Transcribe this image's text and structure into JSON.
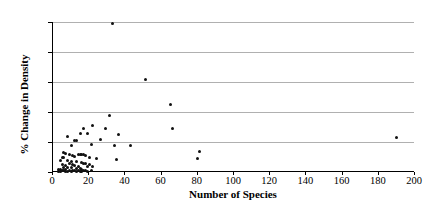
{
  "chart_data": {
    "type": "scatter",
    "title": "",
    "xlabel": "Number of Species",
    "ylabel": "% Change in Density",
    "xlim": [
      0,
      200
    ],
    "ylim": [
      0,
      250
    ],
    "xticks": [
      0,
      20,
      40,
      60,
      80,
      100,
      120,
      140,
      160,
      180,
      200
    ],
    "yticks": [
      0,
      50,
      100,
      150,
      200,
      250
    ],
    "grid": "horizontal",
    "legend": "none",
    "marker_color": "#111111",
    "gridline_color": "#b0b0b0",
    "axis_color": "#000000",
    "series": [
      {
        "name": "sites",
        "points": [
          [
            33,
            248
          ],
          [
            51,
            155
          ],
          [
            65,
            113
          ],
          [
            31,
            94
          ],
          [
            22,
            77
          ],
          [
            17,
            72
          ],
          [
            29,
            72
          ],
          [
            66,
            72
          ],
          [
            8,
            60
          ],
          [
            15,
            65
          ],
          [
            19,
            64
          ],
          [
            36,
            62
          ],
          [
            26,
            54
          ],
          [
            12,
            53
          ],
          [
            13,
            52
          ],
          [
            10,
            45
          ],
          [
            21,
            46
          ],
          [
            34,
            45
          ],
          [
            43,
            45
          ],
          [
            81,
            35
          ],
          [
            190,
            58
          ],
          [
            6,
            32
          ],
          [
            7,
            31
          ],
          [
            9,
            30
          ],
          [
            14,
            30
          ],
          [
            15,
            30
          ],
          [
            16,
            30
          ],
          [
            17,
            29
          ],
          [
            18,
            28
          ],
          [
            11,
            27
          ],
          [
            12,
            26
          ],
          [
            5,
            25
          ],
          [
            6,
            24
          ],
          [
            20,
            24
          ],
          [
            24,
            22
          ],
          [
            35,
            21
          ],
          [
            80,
            23
          ],
          [
            4,
            20
          ],
          [
            8,
            19
          ],
          [
            10,
            18
          ],
          [
            13,
            17
          ],
          [
            16,
            16
          ],
          [
            17,
            15
          ],
          [
            18,
            15
          ],
          [
            9,
            14
          ],
          [
            11,
            13
          ],
          [
            5,
            12
          ],
          [
            7,
            11
          ],
          [
            12,
            11
          ],
          [
            14,
            10
          ],
          [
            19,
            10
          ],
          [
            20,
            12
          ],
          [
            22,
            10
          ],
          [
            6,
            8
          ],
          [
            8,
            7
          ],
          [
            10,
            7
          ],
          [
            13,
            6
          ],
          [
            15,
            6
          ],
          [
            16,
            5
          ],
          [
            3,
            5
          ],
          [
            4,
            4
          ],
          [
            7,
            4
          ],
          [
            9,
            3
          ],
          [
            11,
            3
          ],
          [
            14,
            3
          ],
          [
            17,
            3
          ],
          [
            5,
            2
          ],
          [
            6,
            2
          ],
          [
            12,
            2
          ],
          [
            18,
            2
          ],
          [
            8,
            1
          ],
          [
            10,
            1
          ],
          [
            15,
            1
          ],
          [
            19,
            1
          ],
          [
            21,
            2
          ],
          [
            3,
            1
          ],
          [
            4,
            1
          ],
          [
            7,
            1
          ],
          [
            13,
            1
          ],
          [
            16,
            1
          ]
        ]
      }
    ]
  }
}
